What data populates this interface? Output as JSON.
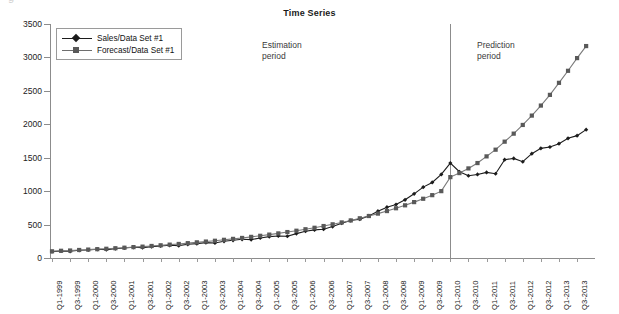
{
  "figure": {
    "title": "Time Series",
    "credit": "© Cengage Learning",
    "top_cropped_text": "g"
  },
  "legend": {
    "items": [
      {
        "label": "Sales/Data Set #1",
        "marker": "diamond",
        "color": "#1c1c1c"
      },
      {
        "label": "Forecast/Data Set #1",
        "marker": "square",
        "color": "#595959"
      }
    ]
  },
  "annotations": [
    {
      "id": "estimation",
      "line1": "Estimation",
      "line2": "period"
    },
    {
      "id": "prediction",
      "line1": "Prediction",
      "line2": "period"
    }
  ],
  "divider": {
    "at_category": "Q1-2010",
    "label": ""
  },
  "chart_data": {
    "type": "line",
    "title": "Time Series",
    "xlabel": "",
    "ylabel": "",
    "ylim": [
      0,
      3500
    ],
    "yticks": [
      0,
      500,
      1000,
      1500,
      2000,
      2500,
      3000,
      3500
    ],
    "grid": false,
    "legend_position": "top-left",
    "x": [
      "Q1-1999",
      "Q2-1999",
      "Q3-1999",
      "Q4-1999",
      "Q1-2000",
      "Q2-2000",
      "Q3-2000",
      "Q4-2000",
      "Q1-2001",
      "Q2-2001",
      "Q3-2001",
      "Q4-2001",
      "Q1-2002",
      "Q2-2002",
      "Q3-2002",
      "Q4-2002",
      "Q1-2003",
      "Q2-2003",
      "Q3-2003",
      "Q4-2003",
      "Q1-2004",
      "Q2-2004",
      "Q3-2004",
      "Q4-2004",
      "Q1-2005",
      "Q2-2005",
      "Q3-2005",
      "Q4-2005",
      "Q1-2006",
      "Q2-2006",
      "Q3-2006",
      "Q4-2006",
      "Q1-2007",
      "Q2-2007",
      "Q3-2007",
      "Q4-2007",
      "Q1-2008",
      "Q2-2008",
      "Q3-2008",
      "Q4-2008",
      "Q1-2009",
      "Q2-2009",
      "Q3-2009",
      "Q4-2009",
      "Q1-2010",
      "Q2-2010",
      "Q3-2010",
      "Q4-2010",
      "Q1-2011",
      "Q2-2011",
      "Q3-2011",
      "Q4-2011",
      "Q1-2012",
      "Q2-2012",
      "Q3-2012",
      "Q4-2012",
      "Q1-2013",
      "Q2-2013",
      "Q3-2013",
      "Q4-2013"
    ],
    "xtick_labels": [
      "Q1-1999",
      "Q3-1999",
      "Q1-2000",
      "Q3-2000",
      "Q1-2001",
      "Q3-2001",
      "Q1-2002",
      "Q3-2002",
      "Q1-2003",
      "Q3-2003",
      "Q1-2004",
      "Q3-2004",
      "Q1-2005",
      "Q3-2005",
      "Q1-2006",
      "Q3-2006",
      "Q1-2007",
      "Q3-2007",
      "Q1-2008",
      "Q3-2008",
      "Q1-2009",
      "Q3-2009",
      "Q1-2010",
      "Q3-2010",
      "Q1-2011",
      "Q3-2011",
      "Q1-2012",
      "Q3-2012",
      "Q1-2013",
      "Q3-2013"
    ],
    "series": [
      {
        "name": "Sales/Data Set #1",
        "marker": "diamond",
        "color": "#1c1c1c",
        "values": [
          95,
          105,
          100,
          115,
          120,
          130,
          125,
          140,
          150,
          160,
          155,
          170,
          180,
          190,
          185,
          205,
          215,
          230,
          225,
          250,
          265,
          280,
          275,
          300,
          320,
          330,
          325,
          365,
          400,
          420,
          430,
          470,
          520,
          560,
          580,
          630,
          700,
          760,
          800,
          870,
          960,
          1060,
          1130,
          1250,
          1420,
          1290,
          1230,
          1250,
          1280,
          1260,
          1470,
          1490,
          1440,
          1560,
          1640,
          1660,
          1710,
          1790,
          1830,
          1920
        ]
      },
      {
        "name": "Forecast/Data Set #1",
        "marker": "square",
        "color": "#595959",
        "values": [
          100,
          108,
          112,
          120,
          126,
          132,
          138,
          146,
          154,
          163,
          170,
          180,
          190,
          200,
          210,
          222,
          234,
          246,
          258,
          272,
          286,
          300,
          316,
          332,
          350,
          368,
          388,
          408,
          430,
          452,
          478,
          504,
          532,
          562,
          594,
          628,
          664,
          702,
          744,
          788,
          836,
          886,
          940,
          1000,
          1210,
          1270,
          1340,
          1420,
          1520,
          1620,
          1740,
          1860,
          1990,
          2130,
          2280,
          2440,
          2620,
          2800,
          2990,
          3170
        ]
      }
    ]
  }
}
